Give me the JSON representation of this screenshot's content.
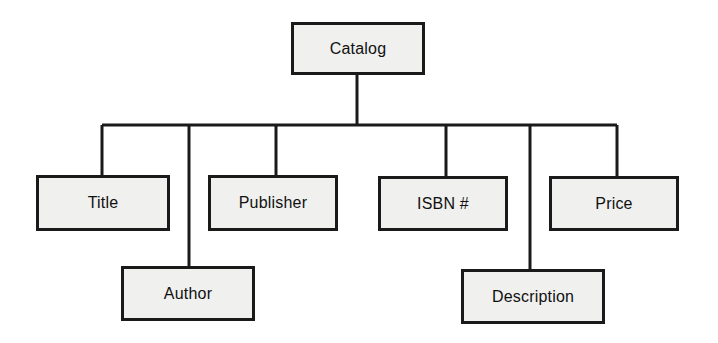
{
  "diagram": {
    "type": "tree-hierarchy",
    "background_color": "#ffffff",
    "box_fill_color": "#f0f0ef",
    "box_border_color": "#1a1a1a",
    "line_color": "#1a1a1a",
    "root": {
      "id": "catalog",
      "label": "Catalog",
      "x": 291,
      "y": 22,
      "width": 134,
      "height": 53
    },
    "children": [
      {
        "id": "title",
        "label": "Title",
        "x": 36,
        "y": 175,
        "width": 134,
        "height": 56,
        "drop_x": 102,
        "row": 1
      },
      {
        "id": "author",
        "label": "Author",
        "x": 121,
        "y": 266,
        "width": 134,
        "height": 55,
        "drop_x": 189,
        "row": 2
      },
      {
        "id": "publisher",
        "label": "Publisher",
        "x": 208,
        "y": 175,
        "width": 130,
        "height": 56,
        "drop_x": 276,
        "row": 1
      },
      {
        "id": "isbn",
        "label": "ISBN #",
        "x": 378,
        "y": 176,
        "width": 130,
        "height": 55,
        "drop_x": 446,
        "row": 1
      },
      {
        "id": "description",
        "label": "Description",
        "x": 461,
        "y": 269,
        "width": 144,
        "height": 55,
        "drop_x": 530,
        "row": 2
      },
      {
        "id": "price",
        "label": "Price",
        "x": 549,
        "y": 176,
        "width": 130,
        "height": 55,
        "drop_x": 617,
        "row": 1
      }
    ],
    "connectors": {
      "stem_x": 357,
      "stem_top": 75,
      "bus_y": 125,
      "bus_left_x": 102,
      "bus_right_x": 617,
      "line_width": 3
    }
  }
}
